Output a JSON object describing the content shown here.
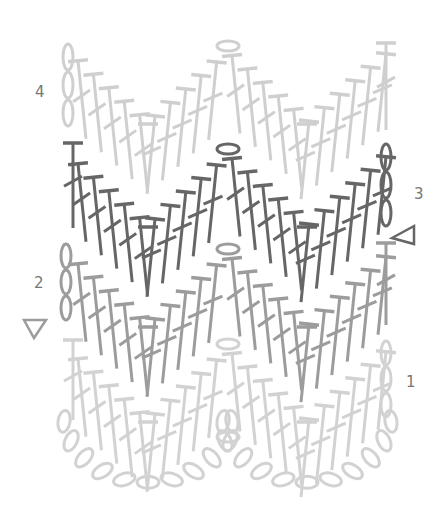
{
  "diagram": {
    "colors": {
      "row1": "#d2d2d2",
      "row2": "#9c9c9c",
      "row3": "#666666",
      "row4": "#cfcfcf",
      "label": "#777777"
    },
    "row_labels": [
      {
        "id": "row-1",
        "text": "1",
        "x": 406,
        "y": 373
      },
      {
        "id": "row-2",
        "text": "2",
        "x": 34,
        "y": 274
      },
      {
        "id": "row-3",
        "text": "3",
        "x": 414,
        "y": 185
      },
      {
        "id": "row-4",
        "text": "4",
        "x": 35,
        "y": 83
      }
    ],
    "markers": [
      {
        "id": "start-marker-row-2",
        "type": "triangle-right",
        "x": 40,
        "y": 328
      },
      {
        "id": "start-marker-row-3",
        "type": "triangle-left",
        "x": 408,
        "y": 232
      }
    ],
    "symbols": {
      "chain": "oval",
      "double_crochet": "T with slash",
      "turning_chain": "stacked chains"
    }
  }
}
